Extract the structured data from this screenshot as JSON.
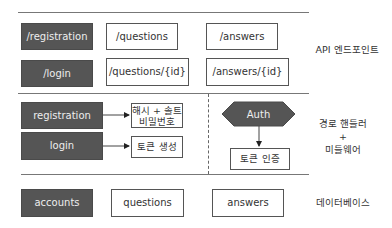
{
  "layers": {
    "api": {
      "label": "API 엔드포인트",
      "auth_endpoints": [
        "/registration",
        "/login"
      ],
      "question_endpoints": [
        "/questions",
        "/questions/{id}"
      ],
      "answer_endpoints": [
        "/answers",
        "/answers/{id}"
      ]
    },
    "handlers": {
      "label_line1": "경로 핸들러",
      "label_line2": "+",
      "label_line3": "미들웨어",
      "registration": "registration",
      "login": "login",
      "hash_line1": "해시 + 솔트",
      "hash_line2": "비밀번호",
      "token_generate": "토큰 생성",
      "auth": "Auth",
      "token_verify": "토큰 인증"
    },
    "database": {
      "label": "데이터베이스",
      "tables": [
        "accounts",
        "questions",
        "answers"
      ]
    }
  },
  "colors": {
    "dark_fill": "#555555",
    "line": "#777777"
  }
}
